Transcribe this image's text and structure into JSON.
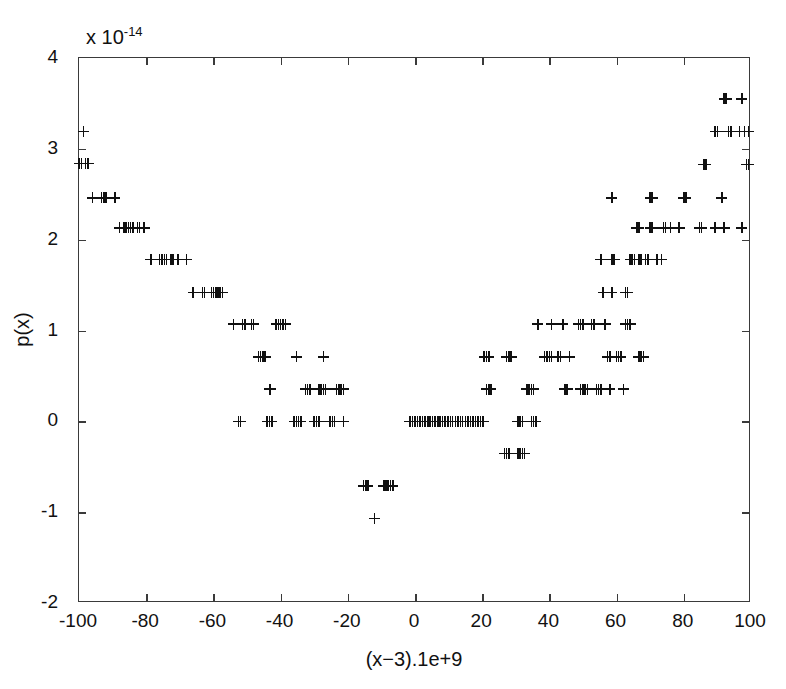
{
  "figure": {
    "exponent_prefix": "x 10",
    "exponent_power": "-14",
    "x_axis_title": "(x−3).1e+9",
    "y_axis_title": "p(x)",
    "marker_symbol": "+",
    "marker_color": "#111111",
    "axis_color": "#3a3a3a",
    "background_color": "#ffffff"
  },
  "chart_data": {
    "type": "scatter",
    "title": "",
    "subtitle": "",
    "xlabel": "(x−3).1e+9",
    "ylabel": "p(x)",
    "y_exponent": "×10^-14",
    "xlim": [
      -100,
      100
    ],
    "ylim": [
      -2,
      4
    ],
    "xticks": [
      -100,
      -80,
      -60,
      -40,
      -20,
      0,
      20,
      40,
      60,
      80,
      100
    ],
    "yticks": [
      -2,
      -1,
      0,
      1,
      2,
      3,
      4
    ],
    "xticklabels": [
      "-100",
      "-80",
      "-60",
      "-40",
      "-20",
      "0",
      "20",
      "40",
      "60",
      "80",
      "100"
    ],
    "yticklabels": [
      "-2",
      "-1",
      "0",
      "1",
      "2",
      "3",
      "4"
    ],
    "grid": false,
    "legend": null,
    "marker": "+",
    "quantization_step": 0.355,
    "note": "Floating-point evaluation of a polynomial near a root; values lie on discrete ULP levels forming a staircase envelope.",
    "points": [
      [
        -100,
        2.84
      ],
      [
        -99.3,
        2.84
      ],
      [
        -98.6,
        3.19
      ],
      [
        -98,
        2.84
      ],
      [
        -97.3,
        2.84
      ],
      [
        -96,
        2.46
      ],
      [
        -93.3,
        2.46
      ],
      [
        -92.6,
        2.46
      ],
      [
        -92,
        2.46
      ],
      [
        -89.3,
        2.46
      ],
      [
        -88,
        2.13
      ],
      [
        -86.6,
        2.13
      ],
      [
        -86,
        2.13
      ],
      [
        -85.3,
        2.13
      ],
      [
        -84.6,
        2.13
      ],
      [
        -84,
        2.13
      ],
      [
        -82.6,
        2.13
      ],
      [
        -82,
        2.13
      ],
      [
        -80.6,
        2.13
      ],
      [
        -78.6,
        1.78
      ],
      [
        -76,
        1.78
      ],
      [
        -75.3,
        1.78
      ],
      [
        -74.6,
        1.78
      ],
      [
        -74,
        1.78
      ],
      [
        -72.6,
        1.78
      ],
      [
        -72,
        1.78
      ],
      [
        -70.6,
        1.78
      ],
      [
        -68,
        1.78
      ],
      [
        -66,
        1.42
      ],
      [
        -63.3,
        1.42
      ],
      [
        -62.6,
        1.42
      ],
      [
        -60.6,
        1.42
      ],
      [
        -60,
        1.42
      ],
      [
        -59.3,
        1.42
      ],
      [
        -58.6,
        1.42
      ],
      [
        -58,
        1.42
      ],
      [
        -57.3,
        1.42
      ],
      [
        -54,
        1.07
      ],
      [
        -51.3,
        1.07
      ],
      [
        -50.6,
        1.07
      ],
      [
        -48.6,
        1.07
      ],
      [
        -48,
        1.07
      ],
      [
        -41.3,
        1.07
      ],
      [
        -40.6,
        1.07
      ],
      [
        -40,
        1.07
      ],
      [
        -39.3,
        1.07
      ],
      [
        -38.6,
        1.07
      ],
      [
        -46.6,
        0.71
      ],
      [
        -46,
        0.71
      ],
      [
        -45.3,
        0.71
      ],
      [
        -44.6,
        0.71
      ],
      [
        -35.3,
        0.71
      ],
      [
        -27.3,
        0.71
      ],
      [
        -43.3,
        0.355
      ],
      [
        -43,
        0.355
      ],
      [
        -32.6,
        0.355
      ],
      [
        -32,
        0.355
      ],
      [
        -31.3,
        0.355
      ],
      [
        -28.6,
        0.355
      ],
      [
        -28,
        0.355
      ],
      [
        -27.3,
        0.355
      ],
      [
        -26.6,
        0.355
      ],
      [
        -23.3,
        0.355
      ],
      [
        -22.6,
        0.355
      ],
      [
        -22,
        0.355
      ],
      [
        -21.3,
        0.355
      ],
      [
        -52.6,
        0.0
      ],
      [
        -52,
        0.0
      ],
      [
        -44,
        0.0
      ],
      [
        -43.3,
        0.0
      ],
      [
        -42.6,
        0.0
      ],
      [
        -36,
        0.0
      ],
      [
        -35.3,
        0.0
      ],
      [
        -34.6,
        0.0
      ],
      [
        -34,
        0.0
      ],
      [
        -30,
        0.0
      ],
      [
        -29.3,
        0.0
      ],
      [
        -28.6,
        0.0
      ],
      [
        -25.3,
        0.0
      ],
      [
        -24.6,
        0.0
      ],
      [
        -24,
        0.0
      ],
      [
        -21.3,
        0.0
      ],
      [
        -15.3,
        -0.71
      ],
      [
        -14.6,
        -0.71
      ],
      [
        -14,
        -0.71
      ],
      [
        -9.3,
        -0.71
      ],
      [
        -8.6,
        -0.71
      ],
      [
        -8,
        -0.71
      ],
      [
        -7.3,
        -0.71
      ],
      [
        -6.6,
        -0.71
      ],
      [
        -12,
        -1.07
      ],
      [
        -1.5,
        0.0
      ],
      [
        -0.8,
        0.0
      ],
      [
        0,
        0.0
      ],
      [
        0.8,
        0.0
      ],
      [
        1.5,
        0.0
      ],
      [
        2.2,
        0.0
      ],
      [
        3,
        0.0
      ],
      [
        3.8,
        0.0
      ],
      [
        4.5,
        0.0
      ],
      [
        5.2,
        0.0
      ],
      [
        6,
        0.0
      ],
      [
        6.8,
        0.0
      ],
      [
        7.5,
        0.0
      ],
      [
        8.2,
        0.0
      ],
      [
        9,
        0.0
      ],
      [
        9.8,
        0.0
      ],
      [
        10.5,
        0.0
      ],
      [
        11.2,
        0.0
      ],
      [
        12,
        0.0
      ],
      [
        12.8,
        0.0
      ],
      [
        13.5,
        0.0
      ],
      [
        14.2,
        0.0
      ],
      [
        15,
        0.0
      ],
      [
        15.8,
        0.0
      ],
      [
        16.5,
        0.0
      ],
      [
        17.2,
        0.0
      ],
      [
        18,
        0.0
      ],
      [
        18.8,
        0.0
      ],
      [
        19.5,
        0.0
      ],
      [
        20.3,
        0.0
      ],
      [
        26.6,
        -0.355
      ],
      [
        27.3,
        -0.355
      ],
      [
        28,
        -0.355
      ],
      [
        30.6,
        -0.355
      ],
      [
        31.3,
        -0.355
      ],
      [
        32,
        -0.355
      ],
      [
        32.6,
        -0.355
      ],
      [
        30.6,
        0.0
      ],
      [
        31.3,
        0.0
      ],
      [
        32,
        0.0
      ],
      [
        34.6,
        0.0
      ],
      [
        35.3,
        0.0
      ],
      [
        36,
        0.0
      ],
      [
        20.6,
        0.71
      ],
      [
        21.3,
        0.71
      ],
      [
        22,
        0.71
      ],
      [
        27.3,
        0.71
      ],
      [
        28,
        0.71
      ],
      [
        28.6,
        0.71
      ],
      [
        21.3,
        0.355
      ],
      [
        22,
        0.355
      ],
      [
        22.6,
        0.355
      ],
      [
        33.3,
        0.355
      ],
      [
        34,
        0.355
      ],
      [
        34.6,
        0.355
      ],
      [
        35.3,
        0.355
      ],
      [
        38.6,
        0.71
      ],
      [
        39.3,
        0.71
      ],
      [
        40,
        0.71
      ],
      [
        40.6,
        0.71
      ],
      [
        42.6,
        0.71
      ],
      [
        43.3,
        0.71
      ],
      [
        46,
        0.71
      ],
      [
        36.6,
        1.07
      ],
      [
        40.6,
        1.07
      ],
      [
        44,
        1.07
      ],
      [
        48.6,
        1.07
      ],
      [
        49.3,
        1.07
      ],
      [
        50,
        1.07
      ],
      [
        52.6,
        1.07
      ],
      [
        53.3,
        1.07
      ],
      [
        56.6,
        1.07
      ],
      [
        44.6,
        0.355
      ],
      [
        45.3,
        0.355
      ],
      [
        49.3,
        0.355
      ],
      [
        50,
        0.355
      ],
      [
        50.6,
        0.355
      ],
      [
        51.3,
        0.355
      ],
      [
        54,
        0.355
      ],
      [
        54.6,
        0.355
      ],
      [
        55.3,
        0.355
      ],
      [
        58,
        0.355
      ],
      [
        62,
        0.355
      ],
      [
        56,
        1.42
      ],
      [
        58.6,
        1.42
      ],
      [
        62.6,
        1.42
      ],
      [
        63.3,
        1.42
      ],
      [
        58.6,
        1.78
      ],
      [
        59.3,
        1.78
      ],
      [
        64,
        1.78
      ],
      [
        64.6,
        1.78
      ],
      [
        65.3,
        1.78
      ],
      [
        66.6,
        1.78
      ],
      [
        67.3,
        1.78
      ],
      [
        68.6,
        1.78
      ],
      [
        69.3,
        1.78
      ],
      [
        72,
        1.78
      ],
      [
        73.3,
        1.78
      ],
      [
        58.6,
        2.46
      ],
      [
        70,
        2.46
      ],
      [
        70.6,
        2.46
      ],
      [
        66,
        2.13
      ],
      [
        66.6,
        2.13
      ],
      [
        70,
        2.13
      ],
      [
        70.6,
        2.13
      ],
      [
        74,
        2.13
      ],
      [
        74.6,
        2.13
      ],
      [
        76,
        2.13
      ],
      [
        78.6,
        2.13
      ],
      [
        84.6,
        2.13
      ],
      [
        85.3,
        2.13
      ],
      [
        89.3,
        2.13
      ],
      [
        92,
        2.13
      ],
      [
        97.3,
        2.13
      ],
      [
        80,
        2.46
      ],
      [
        80.6,
        2.46
      ],
      [
        91.3,
        2.46
      ],
      [
        86,
        2.83
      ],
      [
        86.6,
        2.83
      ],
      [
        98.6,
        2.83
      ],
      [
        99.3,
        2.83
      ],
      [
        89.3,
        3.19
      ],
      [
        90,
        3.19
      ],
      [
        93.3,
        3.19
      ],
      [
        94,
        3.19
      ],
      [
        96.6,
        3.19
      ],
      [
        98,
        3.19
      ],
      [
        99.3,
        3.19
      ],
      [
        92,
        3.55
      ],
      [
        92.6,
        3.55
      ],
      [
        97.3,
        3.55
      ],
      [
        66.6,
        0.71
      ],
      [
        67.3,
        0.71
      ],
      [
        68,
        0.71
      ],
      [
        57.3,
        0.71
      ],
      [
        58,
        0.71
      ],
      [
        60,
        0.71
      ],
      [
        60.6,
        0.71
      ],
      [
        61.3,
        0.71
      ],
      [
        55.3,
        1.78
      ],
      [
        62.6,
        1.07
      ],
      [
        63.3,
        1.07
      ],
      [
        64,
        1.07
      ]
    ]
  }
}
